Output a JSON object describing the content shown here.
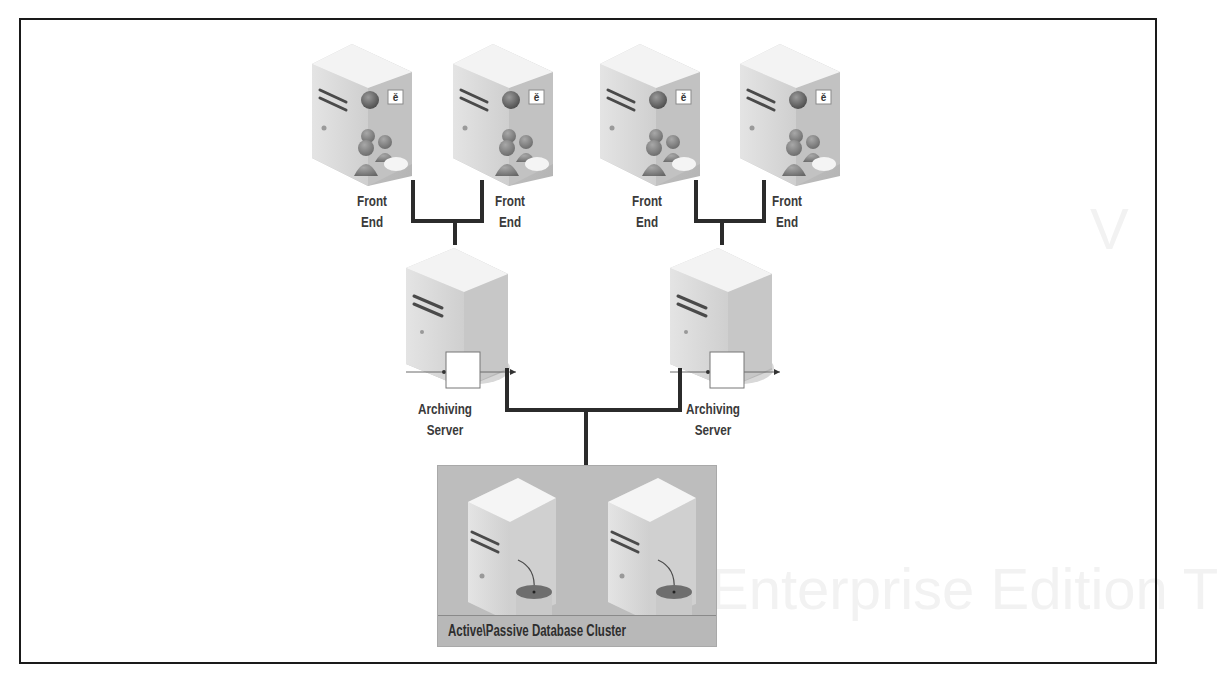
{
  "diagram": {
    "type": "network-topology",
    "nodes": {
      "front_ends": [
        {
          "id": "fe1",
          "label_line1": "Front",
          "label_line2": "End"
        },
        {
          "id": "fe2",
          "label_line1": "Front",
          "label_line2": "End"
        },
        {
          "id": "fe3",
          "label_line1": "Front",
          "label_line2": "End"
        },
        {
          "id": "fe4",
          "label_line1": "Front",
          "label_line2": "End"
        }
      ],
      "archiving_servers": [
        {
          "id": "arch1",
          "label_line1": "Archiving",
          "label_line2": "Server"
        },
        {
          "id": "arch2",
          "label_line1": "Archiving",
          "label_line2": "Server"
        }
      ],
      "database_cluster": {
        "label": "Active\\Passive Database Cluster",
        "servers": 2
      }
    },
    "edges": [
      {
        "from": "fe1",
        "to": "arch1"
      },
      {
        "from": "fe2",
        "to": "arch1"
      },
      {
        "from": "fe3",
        "to": "arch2"
      },
      {
        "from": "fe4",
        "to": "arch2"
      },
      {
        "from": "arch1",
        "to": "database_cluster"
      },
      {
        "from": "arch2",
        "to": "database_cluster"
      }
    ],
    "colors": {
      "frame": "#1a1a1a",
      "wire": "#2b2b2b",
      "server_light": "#eeeeee",
      "server_mid": "#d0d0d0",
      "server_dark": "#b5b5b5",
      "cluster_bg": "#bdbdbd",
      "label_text": "#3a3a3a"
    }
  }
}
